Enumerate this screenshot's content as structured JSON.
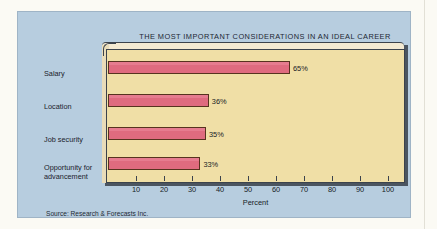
{
  "figure": {
    "source_note": "Source: Research & Forecasts Inc.",
    "panel_color": "#b7cddf",
    "plot_color": "#f0dfa6",
    "bar_color": "#df6b7f",
    "bar_outline_color": "#57331f",
    "frame_color": "#3c434c"
  },
  "chart_data": {
    "type": "bar",
    "orientation": "horizontal",
    "title": "THE MOST IMPORTANT CONSIDERATIONS IN AN IDEAL CAREER",
    "xlabel": "Percent",
    "ylabel": "",
    "categories": [
      "Salary",
      "Location",
      "Job security",
      "Opportunity for advancement"
    ],
    "values": [
      65,
      36,
      35,
      33
    ],
    "value_labels": [
      "65%",
      "36%",
      "35%",
      "33%"
    ],
    "xlim": [
      0,
      100
    ],
    "xticks": [
      10,
      20,
      30,
      40,
      50,
      60,
      70,
      80,
      90,
      100
    ],
    "xtick_labels": [
      "10",
      "20",
      "30",
      "40",
      "50",
      "60",
      "70",
      "80",
      "90",
      "100"
    ],
    "grid": false,
    "legend": null
  }
}
